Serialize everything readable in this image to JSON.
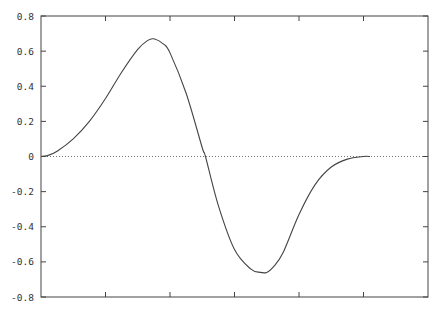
{
  "chart_data": {
    "type": "line",
    "title": "",
    "xlabel": "",
    "ylabel": "",
    "ylim": [
      -0.8,
      0.8
    ],
    "xlim": [
      0,
      6
    ],
    "yticks": [
      0.8,
      0.6,
      0.4,
      0.2,
      0,
      -0.2,
      -0.4,
      -0.6,
      -0.8
    ],
    "ytick_labels": [
      "0.8",
      "0.6",
      "0.4",
      "0.2",
      "0",
      "-0.2",
      "-0.4",
      "-0.6",
      "-0.8"
    ],
    "xticks": [
      1,
      2,
      3,
      4,
      5
    ],
    "xtick_labels": [],
    "grid": false,
    "legend": null,
    "reference_lines": [
      {
        "y": 0,
        "style": "dotted"
      }
    ],
    "series": [
      {
        "name": "curve",
        "x": [
          0,
          0.1,
          0.25,
          0.5,
          0.75,
          1.0,
          1.25,
          1.5,
          1.65,
          1.75,
          1.9,
          2.0,
          2.25,
          2.5,
          2.55,
          2.75,
          3.0,
          3.25,
          3.4,
          3.5,
          3.6,
          3.75,
          4.0,
          4.25,
          4.5,
          4.75,
          5.0,
          5.1
        ],
        "y": [
          0.0,
          0.005,
          0.03,
          0.1,
          0.2,
          0.33,
          0.48,
          0.61,
          0.66,
          0.67,
          0.64,
          0.59,
          0.36,
          0.05,
          0.0,
          -0.28,
          -0.53,
          -0.64,
          -0.66,
          -0.66,
          -0.63,
          -0.55,
          -0.33,
          -0.16,
          -0.06,
          -0.015,
          0.0,
          0.0
        ]
      }
    ]
  }
}
